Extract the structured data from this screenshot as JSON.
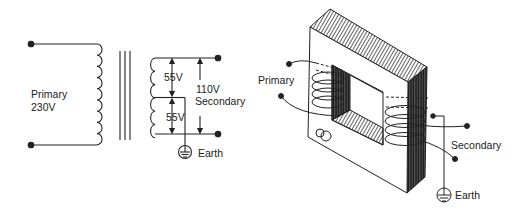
{
  "schematic": {
    "primary_label": "Primary",
    "primary_voltage": "230V",
    "upper_half_voltage": "55V",
    "lower_half_voltage": "55V",
    "secondary_voltage": "110V",
    "secondary_label": "Secondary",
    "earth_label": "Earth"
  },
  "pictorial": {
    "primary_label": "Primary",
    "secondary_label": "Secondary",
    "earth_label": "Earth"
  },
  "colors": {
    "line": "#222222",
    "background": "#ffffff"
  }
}
